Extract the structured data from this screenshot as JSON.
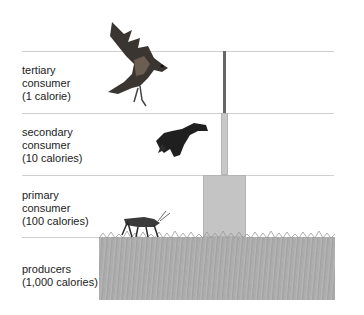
{
  "diagram": {
    "type": "energy-pyramid",
    "levels": [
      {
        "name": "tertiary consumer",
        "line1": "tertiary",
        "line2": "consumer",
        "line3": "(1 calorie)",
        "organism": "hawk"
      },
      {
        "name": "secondary consumer",
        "line1": "secondary",
        "line2": "consumer",
        "line3": "(10 calories)",
        "organism": "blackbird"
      },
      {
        "name": "primary consumer",
        "line1": "primary",
        "line2": "consumer",
        "line3": "(100 calories)",
        "organism": "grasshopper"
      },
      {
        "name": "producers",
        "line1": "producers",
        "line2": "(1,000 calories)",
        "organism": "grass"
      }
    ],
    "colors": {
      "divider": "#cfcfcf",
      "tertiary_bar": "#666666",
      "secondary_bar": "#c8c8c8",
      "primary_bar": "#c4c4c4",
      "producer_block": "#aeaeae"
    }
  }
}
